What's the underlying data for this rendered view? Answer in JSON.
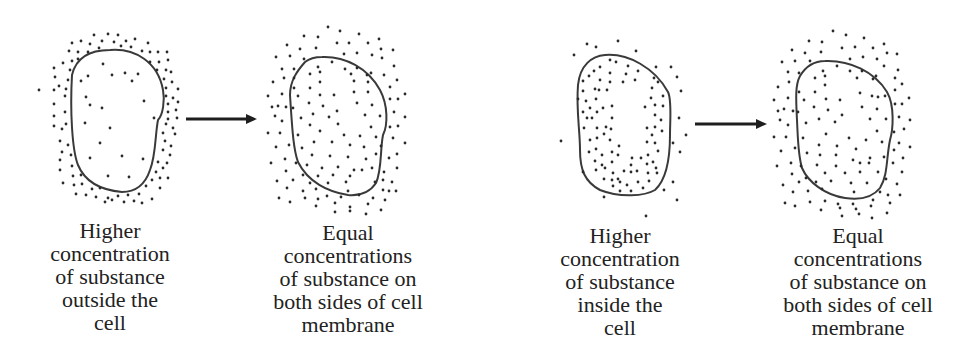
{
  "panels": [
    {
      "id": "before-outside",
      "caption_lines": [
        "Higher",
        "concentration",
        "of substance",
        "outside the",
        "cell"
      ],
      "state": "higher concentration outside"
    },
    {
      "id": "after-outside",
      "caption_lines": [
        "Equal",
        "concentrations",
        "of substance on",
        "both sides of cell",
        "membrane"
      ],
      "state": "equilibrium"
    },
    {
      "id": "before-inside",
      "caption_lines": [
        "Higher",
        "concentration",
        "of substance",
        "inside the",
        "cell"
      ],
      "state": "higher concentration inside"
    },
    {
      "id": "after-inside",
      "caption_lines": [
        "Equal",
        "concentrations",
        "of substance on",
        "both sides of cell",
        "membrane"
      ],
      "state": "equilibrium"
    }
  ],
  "arrows": [
    {
      "from": "before-outside",
      "to": "after-outside",
      "icon": "right-arrow-icon"
    },
    {
      "from": "before-inside",
      "to": "after-inside",
      "icon": "right-arrow-icon"
    }
  ],
  "colors": {
    "ink": "#2a2a2a",
    "background": "#ffffff"
  }
}
